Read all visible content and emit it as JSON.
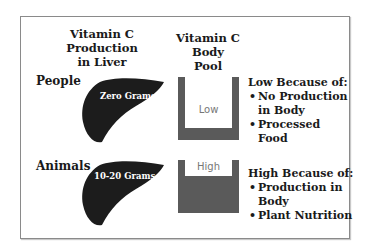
{
  "headers": {
    "production": [
      "Vitamin C",
      "Production",
      "in Liver"
    ],
    "pool": [
      "Vitamin C",
      "Body",
      "Pool"
    ]
  },
  "rows": [
    {
      "label": "People",
      "liver_amount": "Zero Grams",
      "pool_level": "Low",
      "reason_title": "Low Because of:",
      "reasons": [
        "No Production",
        "in Body",
        "Processed Food"
      ]
    },
    {
      "label": "Animals",
      "liver_amount": "10-20 Grams",
      "pool_level": "High",
      "reason_title": "High Because of:",
      "reasons": [
        "Production in Body",
        "Plant Nutrition"
      ]
    }
  ],
  "colors": {
    "liver": "#1c1c1c",
    "container": "#5a5a5a",
    "frame": "#8a8a8a"
  }
}
